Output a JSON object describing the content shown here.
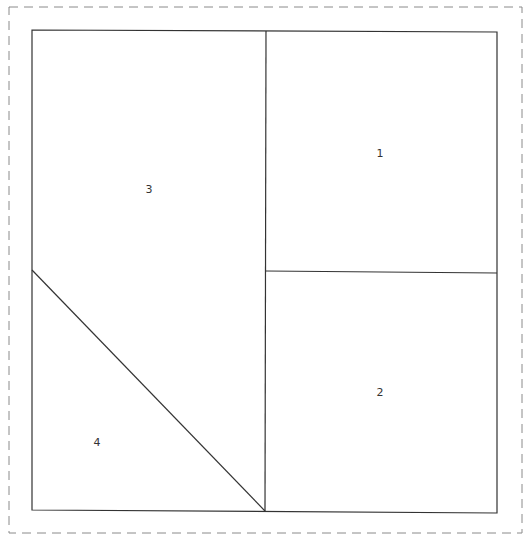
{
  "diagram": {
    "type": "floor-plan-partition",
    "frame": {
      "x1": 9,
      "y1": 7,
      "x2": 522,
      "y2": 533,
      "style": "dashed",
      "color": "#8a8a8a"
    },
    "outline": {
      "points": [
        [
          32,
          30
        ],
        [
          497,
          32
        ],
        [
          497,
          513
        ],
        [
          32,
          510
        ]
      ],
      "color": "#333333"
    },
    "dividers": [
      {
        "name": "vertical-divider",
        "x1": 266,
        "y1": 31,
        "x2": 265,
        "y2": 511
      },
      {
        "name": "horizontal-divider",
        "x1": 266,
        "y1": 271,
        "x2": 497,
        "y2": 273
      },
      {
        "name": "diagonal-divider",
        "x1": 32,
        "y1": 270,
        "x2": 265,
        "y2": 511
      }
    ],
    "regions": [
      {
        "id": "1",
        "label": "1",
        "x": 380,
        "y": 157
      },
      {
        "id": "2",
        "label": "2",
        "x": 380,
        "y": 396
      },
      {
        "id": "3",
        "label": "3",
        "x": 149,
        "y": 193
      },
      {
        "id": "4",
        "label": "4",
        "x": 97,
        "y": 446
      }
    ]
  }
}
